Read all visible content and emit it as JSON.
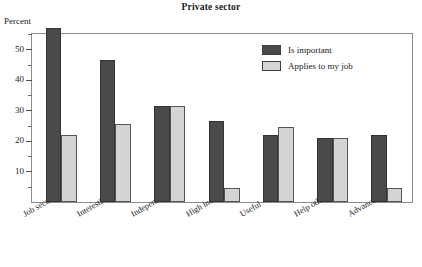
{
  "chart_data": {
    "type": "bar",
    "title": "Private sector",
    "ylabel": "Percent",
    "xlabel": "",
    "ylim": [
      0,
      55
    ],
    "grid": false,
    "legend_position": "top-right",
    "y_ticks": [
      10,
      20,
      30,
      40,
      50
    ],
    "y_tick_labels": [
      "10",
      "20",
      "30",
      "40",
      "50"
    ],
    "y_minor_ticks": [
      5,
      15,
      25,
      35,
      45,
      55
    ],
    "categories": [
      "Job security",
      "Interesting",
      "Independent",
      "High income",
      "Useful",
      "Help others",
      "Advancement"
    ],
    "series": [
      {
        "name": "Is important",
        "color": "#4a4a4a",
        "values": [
          57,
          46.5,
          31.5,
          26.5,
          22,
          21,
          22
        ]
      },
      {
        "name": "Applies to my job",
        "color": "#d4d4d4",
        "values": [
          21.8,
          25.5,
          31.5,
          4.5,
          24.5,
          21,
          4.5
        ]
      }
    ]
  },
  "colors": {
    "important": "#4a4a4a",
    "applies": "#d4d4d4",
    "frame": "#8c8c8c",
    "text": "#1a1a1a"
  }
}
